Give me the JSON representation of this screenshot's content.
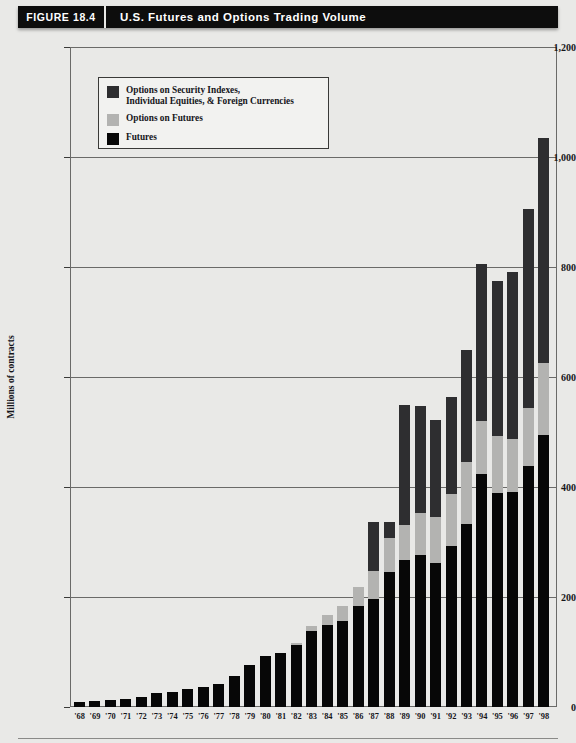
{
  "header": {
    "figure_tag": "FIGURE 18.4",
    "title": "U.S. Futures and Options Trading Volume"
  },
  "legend": {
    "items": [
      {
        "label": "Options on Security Indexes,\nIndividual Equities, & Foreign Currencies",
        "color": "#2e2e30",
        "key": "options_indexes_equities_fx"
      },
      {
        "label": "Options on Futures",
        "color": "#b3b3b1",
        "key": "options_on_futures"
      },
      {
        "label": "Futures",
        "color": "#070707",
        "key": "futures"
      }
    ]
  },
  "axes": {
    "y_title": "Millions of contracts",
    "y_ticks": [
      "0",
      "200",
      "400",
      "600",
      "800",
      "1,000",
      "1,200"
    ],
    "y_tick_values": [
      0,
      200,
      400,
      600,
      800,
      1000,
      1200
    ],
    "ylim": [
      0,
      1200
    ],
    "x_ticks": [
      "'68",
      "'69",
      "'70",
      "'71",
      "'72",
      "'73",
      "'74",
      "'75",
      "'76",
      "'77",
      "'78",
      "'79",
      "'80",
      "'81",
      "'82",
      "'83",
      "'84",
      "'85",
      "'86",
      "'87",
      "'88",
      "'89",
      "'90",
      "'91",
      "'92",
      "'93",
      "'94",
      "'95",
      "'96",
      "'97",
      "'98"
    ]
  },
  "colors": {
    "page_background": "#e9e9e7",
    "header_bar": "#0d0d0d",
    "header_text": "#ffffff",
    "frame": "#6a6a68",
    "futures": "#070707",
    "options_on_futures": "#b3b3b1",
    "options_indexes": "#2e2e30"
  },
  "chart_data": {
    "type": "bar",
    "stacked": true,
    "title": "U.S. Futures and Options Trading Volume",
    "xlabel": "",
    "ylabel": "Millions of contracts",
    "ylim": [
      0,
      1200
    ],
    "grid": true,
    "legend_position": "inside-top-left",
    "categories": [
      "'68",
      "'69",
      "'70",
      "'71",
      "'72",
      "'73",
      "'74",
      "'75",
      "'76",
      "'77",
      "'78",
      "'79",
      "'80",
      "'81",
      "'82",
      "'83",
      "'84",
      "'85",
      "'86",
      "'87",
      "'88",
      "'89",
      "'90",
      "'91",
      "'92",
      "'93",
      "'94",
      "'95",
      "'96",
      "'97",
      "'98"
    ],
    "series": [
      {
        "name": "Futures",
        "color": "#070707",
        "values": [
          10,
          11,
          13,
          14,
          18,
          25,
          27,
          32,
          36,
          42,
          57,
          76,
          92,
          98,
          112,
          139,
          149,
          157,
          184,
          197,
          246,
          267,
          276,
          262,
          292,
          333,
          424,
          390,
          391,
          438,
          495
        ]
      },
      {
        "name": "Options on Futures",
        "color": "#b3b3b1",
        "values": [
          0,
          0,
          0,
          0,
          0,
          0,
          0,
          0,
          0,
          0,
          0,
          0,
          0,
          0,
          4,
          8,
          18,
          26,
          35,
          50,
          62,
          64,
          76,
          83,
          96,
          112,
          96,
          102,
          97,
          105,
          130
        ]
      },
      {
        "name": "Options on Security Indexes, Individual Equities, & Foreign Currencies",
        "color": "#2e2e30",
        "values": [
          0,
          0,
          0,
          0,
          0,
          0,
          0,
          0,
          0,
          0,
          0,
          0,
          0,
          0,
          0,
          0,
          0,
          0,
          0,
          89,
          29,
          218,
          196,
          176,
          176,
          205,
          285,
          282,
          303,
          362,
          410
        ]
      }
    ],
    "totals": [
      10,
      11,
      13,
      14,
      18,
      25,
      27,
      32,
      36,
      42,
      57,
      76,
      92,
      98,
      116,
      147,
      167,
      183,
      219,
      336,
      337,
      549,
      548,
      521,
      564,
      650,
      805,
      774,
      791,
      905,
      1035
    ]
  }
}
